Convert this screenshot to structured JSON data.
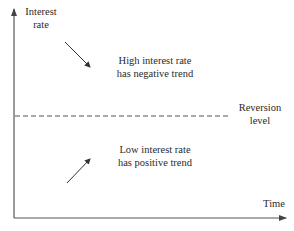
{
  "diagram": {
    "axes": {
      "y_label_line1": "Interest",
      "y_label_line2": "rate",
      "x_label": "Time"
    },
    "reversion_line": {
      "label_line1": "Reversion",
      "label_line2": "level"
    },
    "regions": {
      "high": {
        "line1": "High interest rate",
        "line2": "has negative trend",
        "arrow_direction": "down-right"
      },
      "low": {
        "line1": "Low interest rate",
        "line2": "has positive trend",
        "arrow_direction": "up-right"
      }
    },
    "colors": {
      "axis": "#555555",
      "dashed_line": "#555555",
      "arrow": "#333333",
      "text": "#2a2a2a"
    }
  }
}
